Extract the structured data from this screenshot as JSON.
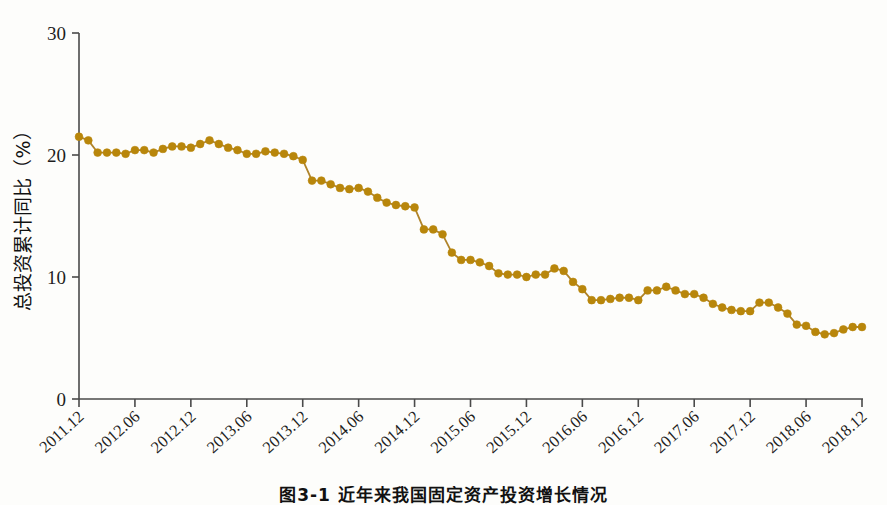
{
  "figure": {
    "caption": "图3-1 近年来我国固定资产投资增长情况"
  },
  "chart_data": {
    "type": "line",
    "title": "",
    "subtitle": "",
    "xlabel": "",
    "ylabel": "总投资累计同比（%）",
    "ylim": [
      0,
      30
    ],
    "yticks": [
      0,
      10,
      20,
      30
    ],
    "ytick_labels": [
      "0",
      "10",
      "20",
      "30"
    ],
    "xtick_labels": [
      "2011.12",
      "2012.06",
      "2012.12",
      "2013.06",
      "2013.12",
      "2014.06",
      "2014.12",
      "2015.06",
      "2015.12",
      "2016.06",
      "2016.12",
      "2017.06",
      "2017.12",
      "2018.06",
      "2018.12"
    ],
    "xtick_positions": [
      0,
      6,
      12,
      18,
      24,
      30,
      36,
      42,
      48,
      54,
      60,
      66,
      72,
      78,
      84
    ],
    "grid": false,
    "legend": null,
    "marker_color": "#b8860b",
    "line_color": "#b0842a",
    "axis_color": "#4a4a4a",
    "x": [
      "2011.12",
      "2012.01",
      "2012.02",
      "2012.03",
      "2012.04",
      "2012.05",
      "2012.06",
      "2012.07",
      "2012.08",
      "2012.09",
      "2012.10",
      "2012.11",
      "2012.12",
      "2013.01",
      "2013.02",
      "2013.03",
      "2013.04",
      "2013.05",
      "2013.06",
      "2013.07",
      "2013.08",
      "2013.09",
      "2013.10",
      "2013.11",
      "2013.12",
      "2014.01",
      "2014.02",
      "2014.03",
      "2014.04",
      "2014.05",
      "2014.06",
      "2014.07",
      "2014.08",
      "2014.09",
      "2014.10",
      "2014.11",
      "2014.12",
      "2015.01",
      "2015.02",
      "2015.03",
      "2015.04",
      "2015.05",
      "2015.06",
      "2015.07",
      "2015.08",
      "2015.09",
      "2015.10",
      "2015.11",
      "2015.12",
      "2016.01",
      "2016.02",
      "2016.03",
      "2016.04",
      "2016.05",
      "2016.06",
      "2016.07",
      "2016.08",
      "2016.09",
      "2016.10",
      "2016.11",
      "2016.12",
      "2017.01",
      "2017.02",
      "2017.03",
      "2017.04",
      "2017.05",
      "2017.06",
      "2017.07",
      "2017.08",
      "2017.09",
      "2017.10",
      "2017.11",
      "2017.12",
      "2018.01",
      "2018.02",
      "2018.03",
      "2018.04",
      "2018.05",
      "2018.06",
      "2018.07",
      "2018.08",
      "2018.09",
      "2018.10",
      "2018.11",
      "2018.12"
    ],
    "values": [
      21.5,
      21.2,
      20.2,
      20.2,
      20.2,
      20.1,
      20.4,
      20.4,
      20.2,
      20.5,
      20.7,
      20.7,
      20.6,
      20.9,
      21.2,
      20.9,
      20.6,
      20.4,
      20.1,
      20.1,
      20.3,
      20.2,
      20.1,
      19.9,
      19.6,
      17.9,
      17.9,
      17.6,
      17.3,
      17.2,
      17.3,
      17.0,
      16.5,
      16.1,
      15.9,
      15.8,
      15.7,
      13.9,
      13.9,
      13.5,
      12.0,
      11.4,
      11.4,
      11.2,
      10.9,
      10.3,
      10.2,
      10.2,
      10.0,
      10.2,
      10.2,
      10.7,
      10.5,
      9.6,
      9.0,
      8.1,
      8.1,
      8.2,
      8.3,
      8.3,
      8.1,
      8.9,
      8.9,
      9.2,
      8.9,
      8.6,
      8.6,
      8.3,
      7.8,
      7.5,
      7.3,
      7.2,
      7.2,
      7.9,
      7.9,
      7.5,
      7.0,
      6.1,
      6.0,
      5.5,
      5.3,
      5.4,
      5.7,
      5.9,
      5.9
    ]
  }
}
